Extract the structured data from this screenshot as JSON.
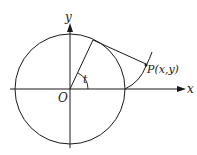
{
  "diagram": {
    "labels": {
      "y_axis": "y",
      "x_axis": "x",
      "origin": "O",
      "angle": "t",
      "point": "P(x,y)"
    },
    "colors": {
      "stroke": "#1a1a1a",
      "background": "#ffffff"
    }
  }
}
